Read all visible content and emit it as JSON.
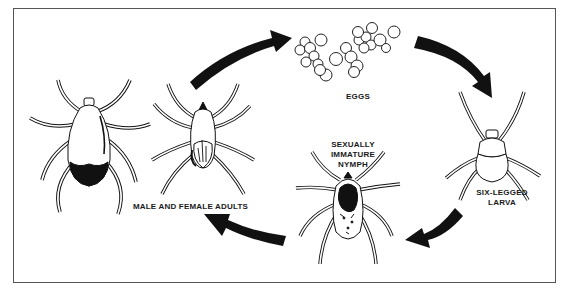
{
  "diagram": {
    "type": "life-cycle",
    "colors": {
      "ink": "#111111",
      "frame": "#555555",
      "background": "#ffffff"
    },
    "stages": [
      {
        "id": "eggs",
        "label": "EGGS"
      },
      {
        "id": "larva",
        "label_line1": "SIX-LEGGED",
        "label_line2": "LARVA"
      },
      {
        "id": "nymph",
        "label_line1": "SEXUALLY",
        "label_line2": "IMMATURE",
        "label_line3": "NYMPH"
      },
      {
        "id": "adults",
        "label": "MALE AND FEMALE ADULTS"
      }
    ],
    "arrows": [
      {
        "from": "adults",
        "to": "eggs"
      },
      {
        "from": "eggs",
        "to": "larva"
      },
      {
        "from": "larva",
        "to": "nymph"
      },
      {
        "from": "nymph",
        "to": "adults"
      }
    ]
  }
}
